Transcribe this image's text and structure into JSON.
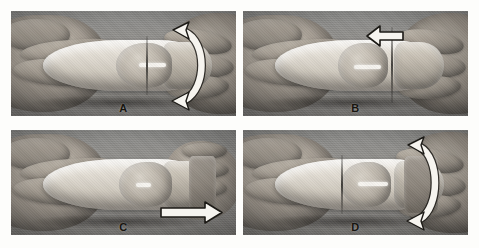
{
  "figure": {
    "type": "photographic-figure",
    "panel_count": 4,
    "layout": "2x2 grid",
    "color_mode": "grayscale",
    "page_background": "#ffffff",
    "photo_background": "#8f8f8f",
    "arrow_fill": "#f6f4ef",
    "arrow_outline": "#1c1a16"
  },
  "panels": [
    {
      "id": "A",
      "label": "A",
      "position": "top-left",
      "arrow": {
        "name": "rotation-arrow",
        "kind": "curved-double-headed",
        "direction": "rotate",
        "location": "right side"
      }
    },
    {
      "id": "B",
      "label": "B",
      "position": "top-right",
      "arrow": {
        "name": "push-left-arrow",
        "kind": "straight-block",
        "direction": "left",
        "location": "top center-right"
      }
    },
    {
      "id": "C",
      "label": "C",
      "position": "bottom-left",
      "arrow": {
        "name": "pull-right-arrow",
        "kind": "straight-block",
        "direction": "right",
        "location": "bottom right"
      }
    },
    {
      "id": "D",
      "label": "D",
      "position": "bottom-right",
      "arrow": {
        "name": "rotation-arrow",
        "kind": "curved-double-headed",
        "direction": "rotate",
        "location": "right side"
      }
    }
  ]
}
